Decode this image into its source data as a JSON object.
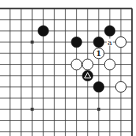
{
  "diagram": {
    "type": "go-board-fragment",
    "visible_edges": [
      "top",
      "right"
    ],
    "columns": 12,
    "rows": 12,
    "colors": {
      "background": "#ffffff",
      "line": "#333333",
      "black_stone": "#111111",
      "white_stone": "#ffffff",
      "stone_outline": "#222222"
    },
    "star_points": [
      {
        "col": 2,
        "row": 3
      },
      {
        "col": 2,
        "row": 9
      },
      {
        "col": 8,
        "row": 9
      }
    ],
    "stones": [
      {
        "color": "black",
        "col": 3,
        "row": 2,
        "mark": ""
      },
      {
        "color": "black",
        "col": 9,
        "row": 2,
        "mark": ""
      },
      {
        "color": "black",
        "col": 6,
        "row": 3,
        "mark": ""
      },
      {
        "color": "black",
        "col": 8,
        "row": 3,
        "mark": ""
      },
      {
        "color": "white",
        "col": 10,
        "row": 3,
        "mark": ""
      },
      {
        "color": "white",
        "col": 8,
        "row": 4,
        "mark": "1"
      },
      {
        "color": "white",
        "col": 6,
        "row": 5,
        "mark": ""
      },
      {
        "color": "white",
        "col": 7,
        "row": 5,
        "mark": ""
      },
      {
        "color": "white",
        "col": 9,
        "row": 5,
        "mark": ""
      },
      {
        "color": "black",
        "col": 7,
        "row": 6,
        "mark": "triangle"
      },
      {
        "color": "black",
        "col": 8,
        "row": 7,
        "mark": ""
      },
      {
        "color": "white",
        "col": 10,
        "row": 7,
        "mark": ""
      }
    ],
    "labels": [
      {
        "text": "a",
        "col": 9,
        "row": 3
      }
    ]
  }
}
